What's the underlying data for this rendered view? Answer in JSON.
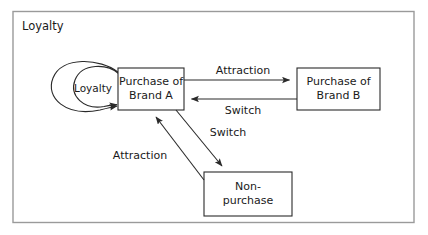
{
  "diagram": {
    "type": "flow-diagram",
    "frame": {
      "label": "Loyalty"
    },
    "nodes": [
      {
        "id": "brand-a",
        "label_line1": "Purchase of",
        "label_line2": "Brand A"
      },
      {
        "id": "brand-b",
        "label_line1": "Purchase of",
        "label_line2": "Brand B"
      },
      {
        "id": "non-purchase",
        "label_line1": "Non-",
        "label_line2": "purchase"
      }
    ],
    "loops": [
      {
        "id": "loyalty-loop-inner",
        "label": "Loyalty"
      },
      {
        "id": "loyalty-loop-outer",
        "label": ""
      }
    ],
    "edges": [
      {
        "id": "a-to-b",
        "label": "Attraction",
        "from": "brand-a",
        "to": "brand-b"
      },
      {
        "id": "b-to-a",
        "label": "Switch",
        "from": "brand-b",
        "to": "brand-a"
      },
      {
        "id": "a-to-np",
        "label": "Switch",
        "from": "brand-a",
        "to": "non-purchase"
      },
      {
        "id": "np-to-a",
        "label": "Attraction",
        "from": "non-purchase",
        "to": "brand-a"
      }
    ],
    "colors": {
      "stroke": "#2a2a2a",
      "frame_stroke": "#9a9a9a",
      "background": "#ffffff",
      "text": "#1a1a1a"
    }
  }
}
